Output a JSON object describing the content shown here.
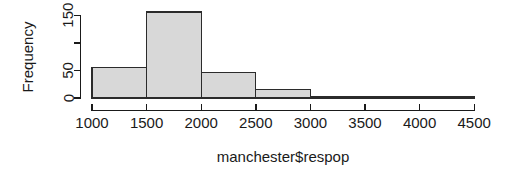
{
  "chart_data": {
    "type": "bar",
    "chart_style": "histogram",
    "title": "",
    "xlabel": "manchester$respop",
    "ylabel": "Frequency",
    "bin_width": 500,
    "bin_edges": [
      1000,
      1500,
      2000,
      2500,
      3000,
      3500,
      4000,
      4500
    ],
    "categories": [
      "1000-1500",
      "1500-2000",
      "2000-2500",
      "2500-3000",
      "3000-3500",
      "3500-4000",
      "4000-4500"
    ],
    "values": [
      55,
      156,
      46,
      16,
      3,
      1,
      2
    ],
    "xlim": [
      1000,
      4500
    ],
    "ylim": [
      0,
      160
    ],
    "x_ticks": [
      1000,
      1500,
      2000,
      2500,
      3000,
      3500,
      4000,
      4500
    ],
    "x_tick_labels": [
      "1000",
      "1500",
      "2000",
      "2500",
      "3000",
      "3500",
      "4000",
      "4500"
    ],
    "y_ticks": [
      0,
      50,
      100,
      150
    ],
    "y_tick_labels": [
      "0",
      "50",
      "",
      "150"
    ],
    "y_labeled_ticks": [
      0,
      50,
      150
    ],
    "grid": false,
    "legend": false,
    "bar_fill_color": "#d8d8d8",
    "bar_border_color": "#2b2b2b",
    "axis_color": "#1a1a1a"
  },
  "labels": {
    "y_0": "0",
    "y_50": "50",
    "y_150": "150",
    "x_1000": "1000",
    "x_1500": "1500",
    "x_2000": "2000",
    "x_2500": "2500",
    "x_3000": "3000",
    "x_3500": "3500",
    "x_4000": "4000",
    "x_4500": "4500",
    "y_axis_title": "Frequency",
    "x_axis_title": "manchester$respop"
  }
}
